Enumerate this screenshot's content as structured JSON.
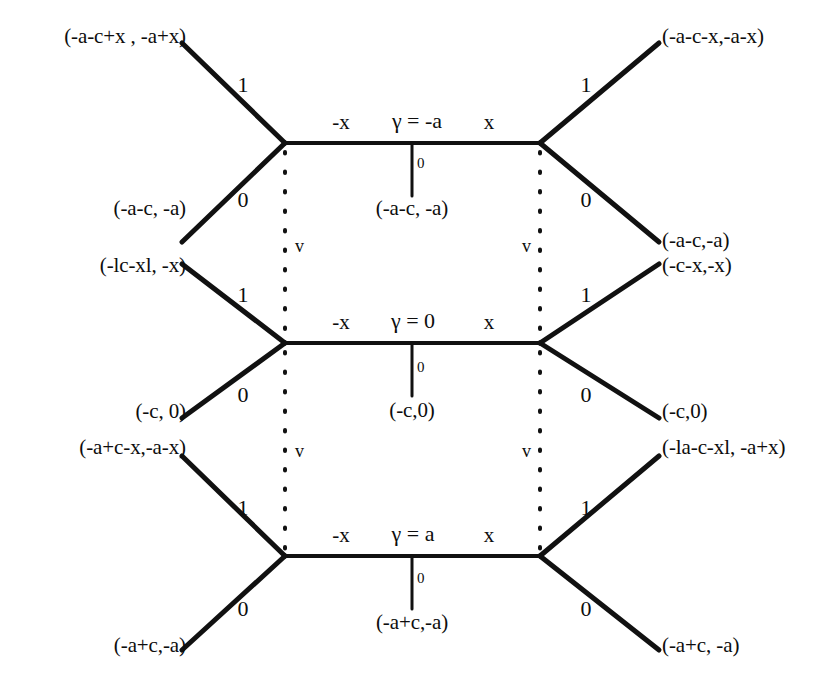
{
  "diagram": {
    "stroke_color": "#111111",
    "background_color": "#ffffff",
    "rows": [
      {
        "id": "row-top",
        "gamma_label": "γ = -a",
        "spine_left_label": "-x",
        "spine_right_label": "x",
        "stub_weight": "0",
        "stub_label": "(-a-c, -a)",
        "upper_left": {
          "weight": "1",
          "endpoint": "(-a-c+x , -a+x)"
        },
        "lower_left": {
          "weight": "0",
          "endpoint": "(-a-c, -a)"
        },
        "upper_right": {
          "weight": "1",
          "endpoint": "(-a-c-x,-a-x)"
        },
        "lower_right": {
          "weight": "0",
          "endpoint": "(-a-c,-a)"
        }
      },
      {
        "id": "row-middle",
        "gamma_label": "γ = 0",
        "spine_left_label": "-x",
        "spine_right_label": "x",
        "stub_weight": "0",
        "stub_label": "(-c,0)",
        "upper_left": {
          "weight": "1",
          "endpoint": "(-lc-xl, -x)"
        },
        "lower_left": {
          "weight": "0",
          "endpoint": "(-c, 0)"
        },
        "upper_right": {
          "weight": "1",
          "endpoint": "(-c-x,-x)"
        },
        "lower_right": {
          "weight": "0",
          "endpoint": "(-c,0)"
        }
      },
      {
        "id": "row-bottom",
        "gamma_label": "γ = a",
        "spine_left_label": "-x",
        "spine_right_label": "x",
        "stub_weight": "0",
        "stub_label": "(-a+c,-a)",
        "upper_left": {
          "weight": "1",
          "endpoint": "(-a+c-x,-a-x)"
        },
        "lower_left": {
          "weight": "0",
          "endpoint": "(-a+c,-a)"
        },
        "upper_right": {
          "weight": "1",
          "endpoint": "(-la-c-xl, -a+x)"
        },
        "lower_right": {
          "weight": "0",
          "endpoint": "(-a+c, -a)"
        }
      }
    ],
    "vertical_markers": [
      {
        "id": "v-left-upper",
        "label": "v"
      },
      {
        "id": "v-right-upper",
        "label": "v"
      },
      {
        "id": "v-left-lower",
        "label": "v"
      },
      {
        "id": "v-right-lower",
        "label": "v"
      }
    ]
  }
}
